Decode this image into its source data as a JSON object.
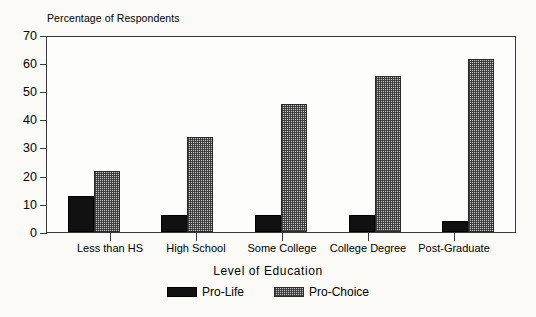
{
  "chart_data": {
    "type": "bar",
    "title": "",
    "ylabel": "Percentage of Respondents",
    "xlabel": "Level  of  Education",
    "categories": [
      "Less than HS",
      "High School",
      "Some College",
      "College Degree",
      "Post-Graduate"
    ],
    "series": [
      {
        "name": "Pro-Life",
        "values": [
          13,
          6,
          6,
          6,
          4
        ],
        "color": "#111111",
        "pattern": "solid-black"
      },
      {
        "name": "Pro-Choice",
        "values": [
          22,
          34,
          46,
          56,
          62
        ],
        "color": "#c9c9c9",
        "pattern": "dotted-gray"
      }
    ],
    "ylim": [
      0,
      70
    ],
    "yticks": [
      0,
      10,
      20,
      30,
      40,
      50,
      60,
      70
    ],
    "ytick_labels": [
      "0",
      "10",
      "20",
      "30",
      "40",
      "50",
      "60",
      "70"
    ],
    "grid": false,
    "legend_position": "bottom-center",
    "frame": true
  },
  "legend": {
    "items": [
      {
        "label": "Pro-Life"
      },
      {
        "label": "Pro-Choice"
      }
    ]
  }
}
